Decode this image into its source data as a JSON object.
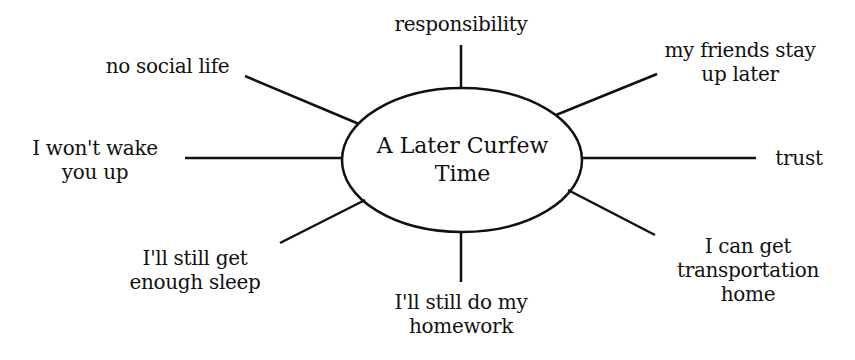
{
  "center": {
    "line1": "A Later Curfew",
    "line2": "Time"
  },
  "branches": [
    {
      "id": "responsibility",
      "lines": [
        "responsibility"
      ]
    },
    {
      "id": "friends",
      "lines": [
        "my friends stay",
        "up later"
      ]
    },
    {
      "id": "trust",
      "lines": [
        "trust"
      ]
    },
    {
      "id": "transportation",
      "lines": [
        "I can get",
        "transportation",
        "home"
      ]
    },
    {
      "id": "homework",
      "lines": [
        "I'll still do my",
        "homework"
      ]
    },
    {
      "id": "sleep",
      "lines": [
        "I'll still get",
        "enough sleep"
      ]
    },
    {
      "id": "wake",
      "lines": [
        "I won't wake",
        "you up"
      ]
    },
    {
      "id": "social",
      "lines": [
        "no social life"
      ]
    }
  ],
  "colors": {
    "stroke": "#111111",
    "background": "#ffffff"
  }
}
